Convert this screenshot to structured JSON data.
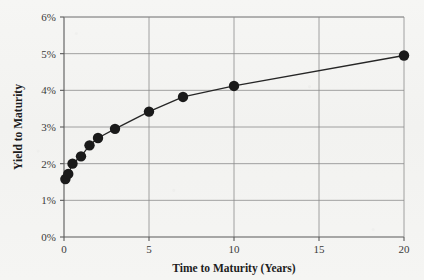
{
  "figure": {
    "background_color": "#f4f4f2",
    "plot_area": {
      "left": 64,
      "right": 404,
      "top": 17,
      "bottom": 237
    }
  },
  "chart_data": {
    "type": "line",
    "title": "",
    "xlabel": "Time to Maturity (Years)",
    "ylabel": "Yield to Maturity",
    "xlim": [
      0,
      20
    ],
    "ylim": [
      0,
      6
    ],
    "grid": true,
    "legend": null,
    "marker": "filled-circle",
    "marker_color": "#1a1a1a",
    "line_color": "#262626",
    "xticks": [
      0,
      5,
      10,
      15,
      20
    ],
    "xtick_labels": [
      "0",
      "5",
      "10",
      "15",
      "20"
    ],
    "yticks": [
      0,
      1,
      2,
      3,
      4,
      5,
      6
    ],
    "ytick_labels": [
      "0%",
      "1%",
      "2%",
      "3%",
      "4%",
      "5%",
      "6%"
    ],
    "x": [
      0.08,
      0.25,
      0.5,
      1,
      1.5,
      2,
      3,
      5,
      7,
      10,
      20
    ],
    "y": [
      1.58,
      1.72,
      2.0,
      2.2,
      2.5,
      2.7,
      2.95,
      3.42,
      3.82,
      4.12,
      4.95
    ],
    "series": [
      {
        "name": "Yield curve",
        "points": [
          {
            "x": 0.08,
            "y": 1.58
          },
          {
            "x": 0.25,
            "y": 1.72
          },
          {
            "x": 0.5,
            "y": 2.0
          },
          {
            "x": 1,
            "y": 2.2
          },
          {
            "x": 1.5,
            "y": 2.5
          },
          {
            "x": 2,
            "y": 2.7
          },
          {
            "x": 3,
            "y": 2.95
          },
          {
            "x": 5,
            "y": 3.42
          },
          {
            "x": 7,
            "y": 3.82
          },
          {
            "x": 10,
            "y": 4.12
          },
          {
            "x": 20,
            "y": 4.95
          }
        ]
      }
    ]
  }
}
